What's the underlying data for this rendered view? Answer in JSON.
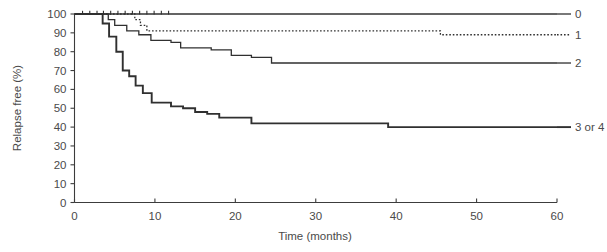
{
  "chart_data": {
    "type": "line",
    "subtype": "kaplan-meier-step",
    "title": "",
    "xlabel": "Time (months)",
    "ylabel": "Relapse free (%)",
    "xlim": [
      0,
      60
    ],
    "ylim": [
      0,
      100
    ],
    "xticks": [
      0,
      10,
      20,
      30,
      40,
      50,
      60
    ],
    "yticks": [
      0,
      10,
      20,
      30,
      40,
      50,
      60,
      70,
      80,
      90,
      100
    ],
    "xtick_labels": [
      "0",
      "10",
      "20",
      "30",
      "40",
      "50",
      "60"
    ],
    "ytick_labels": [
      "0",
      "10",
      "20",
      "30",
      "40",
      "50",
      "60",
      "70",
      "80",
      "90",
      "100"
    ],
    "grid": false,
    "legend_position": "right-of-plot-at-curve-ends",
    "line_color": "#303030",
    "series": [
      {
        "name": "0",
        "label": "0",
        "style": "solid",
        "steps": [
          [
            0,
            100
          ],
          [
            60,
            100
          ]
        ],
        "censor_marks": [
          1.0,
          1.9,
          2.8,
          3.6,
          4.5,
          5.4,
          6.3,
          7.2,
          8.1,
          9.0,
          9.9,
          10.8,
          11.7
        ],
        "final_value": 100
      },
      {
        "name": "1",
        "label": "1",
        "style": "dotted",
        "steps": [
          [
            0,
            100
          ],
          [
            7.5,
            100
          ],
          [
            7.5,
            97
          ],
          [
            8.2,
            97
          ],
          [
            8.2,
            94
          ],
          [
            9.0,
            94
          ],
          [
            9.0,
            91
          ],
          [
            45.5,
            91
          ],
          [
            45.5,
            89
          ],
          [
            60,
            89
          ]
        ],
        "censor_marks": [],
        "final_value": 89
      },
      {
        "name": "2",
        "label": "2",
        "style": "solid",
        "steps": [
          [
            0,
            100
          ],
          [
            4.2,
            100
          ],
          [
            4.2,
            97
          ],
          [
            5.0,
            97
          ],
          [
            5.0,
            94
          ],
          [
            6.5,
            94
          ],
          [
            6.5,
            91
          ],
          [
            8.0,
            91
          ],
          [
            8.0,
            89
          ],
          [
            9.5,
            89
          ],
          [
            9.5,
            86
          ],
          [
            12.0,
            86
          ],
          [
            12.0,
            85
          ],
          [
            13.2,
            85
          ],
          [
            13.2,
            82
          ],
          [
            17.0,
            82
          ],
          [
            17.0,
            81
          ],
          [
            19.5,
            81
          ],
          [
            19.5,
            78
          ],
          [
            22.0,
            78
          ],
          [
            22.0,
            77
          ],
          [
            24.5,
            77
          ],
          [
            24.5,
            74
          ],
          [
            60,
            74
          ]
        ],
        "censor_marks": [],
        "final_value": 74
      },
      {
        "name": "3 or 4",
        "label": "3 or 4",
        "style": "solid-bold",
        "steps": [
          [
            0,
            100
          ],
          [
            3.5,
            100
          ],
          [
            3.5,
            95
          ],
          [
            4.3,
            95
          ],
          [
            4.3,
            88
          ],
          [
            5.2,
            88
          ],
          [
            5.2,
            80
          ],
          [
            6.0,
            80
          ],
          [
            6.0,
            70
          ],
          [
            6.8,
            70
          ],
          [
            6.8,
            67
          ],
          [
            7.6,
            67
          ],
          [
            7.6,
            62
          ],
          [
            8.5,
            62
          ],
          [
            8.5,
            58
          ],
          [
            9.6,
            58
          ],
          [
            9.6,
            53
          ],
          [
            12.0,
            53
          ],
          [
            12.0,
            51
          ],
          [
            13.5,
            51
          ],
          [
            13.5,
            50
          ],
          [
            15.0,
            50
          ],
          [
            15.0,
            48
          ],
          [
            16.5,
            48
          ],
          [
            16.5,
            47
          ],
          [
            18.0,
            47
          ],
          [
            18.0,
            45
          ],
          [
            22.0,
            45
          ],
          [
            22.0,
            42
          ],
          [
            39.0,
            42
          ],
          [
            39.0,
            40
          ],
          [
            60,
            40
          ]
        ],
        "censor_marks": [],
        "final_value": 40
      }
    ]
  },
  "axes": {
    "y_axis_title": "Relapse free (%)",
    "x_axis_title": "Time (months)"
  },
  "legend": {
    "items": [
      {
        "label": "0"
      },
      {
        "label": "1"
      },
      {
        "label": "2"
      },
      {
        "label": "3 or 4"
      }
    ]
  }
}
